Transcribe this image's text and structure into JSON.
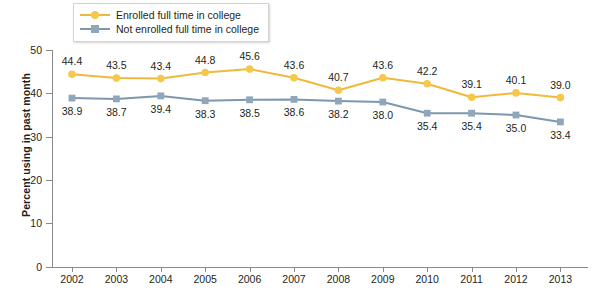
{
  "chart_data": {
    "type": "line",
    "title": "",
    "xlabel": "",
    "ylabel": "Percent using in past month",
    "categories": [
      "2002",
      "2003",
      "2004",
      "2005",
      "2006",
      "2007",
      "2008",
      "2009",
      "2010",
      "2011",
      "2012",
      "2013"
    ],
    "ylim": [
      0,
      50
    ],
    "yticks": [
      0,
      10,
      20,
      30,
      40,
      50
    ],
    "grid": false,
    "legend_position": "top-left",
    "series": [
      {
        "name": "Enrolled full time in college",
        "color": "#f0b93b",
        "marker": "circle",
        "values": [
          44.4,
          43.5,
          43.4,
          44.8,
          45.6,
          43.6,
          40.7,
          43.6,
          42.2,
          39.1,
          40.1,
          39.0
        ],
        "label_offsets": [
          "above",
          "above",
          "above",
          "above",
          "above",
          "above",
          "above",
          "above",
          "above",
          "above",
          "above",
          "above"
        ]
      },
      {
        "name": "Not enrolled full time in college",
        "color": "#7c97ae",
        "marker": "square",
        "values": [
          38.9,
          38.7,
          39.4,
          38.3,
          38.5,
          38.6,
          38.2,
          38.0,
          35.4,
          35.4,
          35.0,
          33.4
        ],
        "label_offsets": [
          "below",
          "below",
          "below",
          "below",
          "below",
          "below",
          "below",
          "below",
          "below",
          "below",
          "below",
          "below"
        ]
      }
    ]
  },
  "legend": {
    "items": [
      {
        "label": "Enrolled full time in college"
      },
      {
        "label": "Not enrolled full time in college"
      }
    ]
  },
  "axes": {
    "y_title": "Percent using in past month",
    "y_tick_labels": [
      "0",
      "10",
      "20",
      "30",
      "40",
      "50"
    ],
    "x_tick_labels": [
      "2002",
      "2003",
      "2004",
      "2005",
      "2006",
      "2007",
      "2008",
      "2009",
      "2010",
      "2011",
      "2012",
      "2013"
    ]
  }
}
